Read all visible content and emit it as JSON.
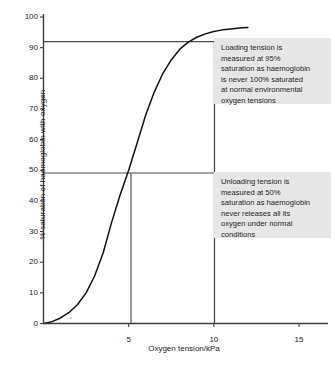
{
  "chart_data": {
    "type": "line",
    "title": "",
    "xlabel": "Oxygen tension/kPa",
    "ylabel": "% saturation of haemoglobin with oxygen",
    "xlim": [
      0,
      16.7
    ],
    "ylim": [
      0,
      103
    ],
    "xticks": [
      0,
      5,
      10,
      15
    ],
    "yticks": [
      0,
      10,
      20,
      30,
      40,
      50,
      60,
      70,
      80,
      90,
      100
    ],
    "grid": false,
    "legend": null,
    "series": [
      {
        "name": "oxyhaemoglobin dissociation curve",
        "color": "#111111",
        "x": [
          0.0,
          0.5,
          1.0,
          1.5,
          2.0,
          2.5,
          3.0,
          3.5,
          4.0,
          4.5,
          5.0,
          5.5,
          6.0,
          6.5,
          7.0,
          7.5,
          8.0,
          8.5,
          9.0,
          9.5,
          10.0,
          10.5,
          11.0,
          11.5,
          12.0
        ],
        "y": [
          0.0,
          0.6,
          1.8,
          3.6,
          6.2,
          10.0,
          15.5,
          23.0,
          33.0,
          42.0,
          50.0,
          59.0,
          68.0,
          75.5,
          81.5,
          86.0,
          89.5,
          91.8,
          93.4,
          94.5,
          95.3,
          95.8,
          96.1,
          96.4,
          96.6
        ]
      }
    ],
    "reference_lines": [
      {
        "name": "loading-tension-horizontal",
        "orientation": "horizontal",
        "value": 95,
        "label": "95% saturation"
      },
      {
        "name": "unloading-tension-horizontal",
        "orientation": "horizontal",
        "value": 50,
        "label": "50% saturation"
      },
      {
        "name": "loading-tension-vertical",
        "orientation": "vertical",
        "value": 10,
        "label": "loading tension 10 kPa"
      },
      {
        "name": "unloading-tension-vertical",
        "orientation": "vertical",
        "value": 5,
        "label": "unloading tension 5 kPa"
      }
    ],
    "annotations": [
      {
        "name": "loading-tension-note",
        "lines": [
          "Loading tension is",
          "measured at 95%",
          "saturation as haemoglobin",
          "is never 100% saturated",
          "at normal environmental",
          "oxygen tensions"
        ]
      },
      {
        "name": "unloading-tension-note",
        "lines": [
          "Unloading tension is",
          "measured at 50%",
          "saturation as haemoglobin",
          "never releases all its",
          "oxygen under normal",
          "conditions"
        ]
      }
    ],
    "colors": {
      "curve": "#111111",
      "axis": "#3c3c3c",
      "reference_line": "#4a4a4a",
      "annotation_background": "#e6e6e6",
      "plot_background": "#ffffff",
      "text": "#1a1a1a"
    }
  }
}
